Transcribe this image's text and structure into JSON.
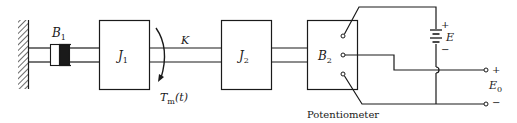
{
  "diagram": {
    "type": "mechanical-electrical schematic",
    "components": {
      "wall": {
        "name": "fixed-wall"
      },
      "damper_1": {
        "symbol": "B",
        "subscript": "1"
      },
      "inertia_1": {
        "symbol": "J",
        "subscript": "1"
      },
      "torque": {
        "symbol": "T",
        "subscript": "m",
        "argument": "(t)"
      },
      "spring": {
        "symbol": "K"
      },
      "inertia_2": {
        "symbol": "J",
        "subscript": "2"
      },
      "damper_2": {
        "symbol": "B",
        "subscript": "2"
      },
      "battery": {
        "symbol": "E",
        "plus": "+",
        "minus": "−"
      },
      "output": {
        "symbol": "E",
        "subscript": "0",
        "plus": "+",
        "minus": "−"
      },
      "potentiometer_caption": "Potentiometer"
    },
    "colors": {
      "line": "#1a1a1a",
      "background": "#ffffff"
    }
  }
}
